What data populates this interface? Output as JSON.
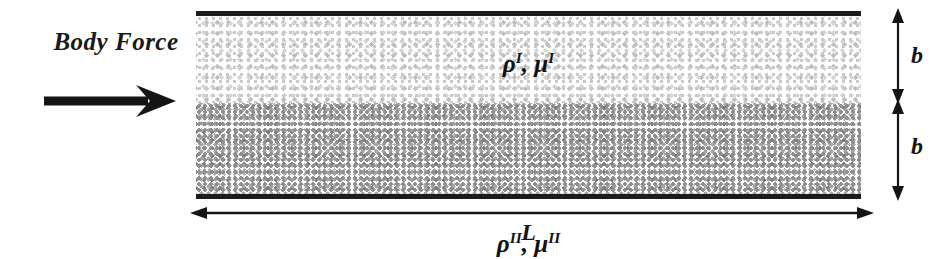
{
  "figure": {
    "type": "two-layer-channel-flow-schematic",
    "background_color": "#ffffff",
    "line_color": "#1c1c1c"
  },
  "body_force": {
    "label": "Body Force",
    "arrow_icon": "right-arrow-icon",
    "direction": "right"
  },
  "channel": {
    "wall_top_name": "top-wall",
    "wall_bottom_name": "bottom-wall",
    "layers": [
      {
        "id": "upper",
        "label_density": "ρ",
        "label_viscosity": "μ",
        "superscript": "I",
        "fill": "light-stipple",
        "fill_color": "#c9c9c9"
      },
      {
        "id": "lower",
        "label_density": "ρ",
        "label_viscosity": "μ",
        "superscript": "II",
        "fill": "dark-stipple",
        "fill_color": "#8f8f8f"
      }
    ]
  },
  "dimensions": {
    "height_upper": "b",
    "height_lower": "b",
    "length": "L",
    "vertical_arrow_icon": "double-headed-vertical-arrow-icon",
    "horizontal_arrow_icon": "double-headed-horizontal-arrow-icon"
  }
}
